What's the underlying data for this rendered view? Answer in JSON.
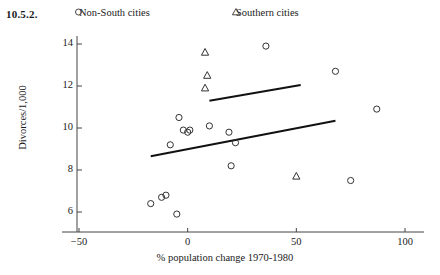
{
  "figure_number": "10.5.2.",
  "legend": [
    {
      "marker": "circle-marker-icon",
      "label": "Non-South cities"
    },
    {
      "marker": "triangle-marker-icon",
      "label": "Southern cities"
    }
  ],
  "chart_data": {
    "type": "scatter",
    "title": "",
    "xlabel": "% population change 1970-1980",
    "ylabel": "Divorces/1,000",
    "xlim": [
      -60,
      110
    ],
    "ylim": [
      5.2,
      14.8
    ],
    "xticks": [
      -50,
      0,
      50,
      100
    ],
    "xtick_labels": [
      "−50",
      "0",
      "50",
      "100"
    ],
    "yticks": [
      6,
      8,
      10,
      12,
      14
    ],
    "ytick_labels": [
      "6",
      "8",
      "10",
      "12",
      "14"
    ],
    "grid": false,
    "legend_position": "top",
    "series": [
      {
        "name": "Non-South cities",
        "marker": "circle",
        "points": [
          [
            -17,
            6.4
          ],
          [
            -12,
            6.7
          ],
          [
            -10,
            6.8
          ],
          [
            -5,
            5.9
          ],
          [
            -8,
            9.2
          ],
          [
            -4,
            10.5
          ],
          [
            -2,
            9.9
          ],
          [
            0,
            9.8
          ],
          [
            1,
            9.9
          ],
          [
            10,
            10.1
          ],
          [
            19,
            9.8
          ],
          [
            20,
            8.2
          ],
          [
            22,
            9.3
          ],
          [
            36,
            13.9
          ],
          [
            68,
            12.7
          ],
          [
            75,
            7.5
          ],
          [
            87,
            10.9
          ]
        ]
      },
      {
        "name": "Southern cities",
        "marker": "triangle",
        "points": [
          [
            8,
            13.6
          ],
          [
            9,
            12.5
          ],
          [
            8,
            11.9
          ],
          [
            50,
            7.7
          ]
        ]
      }
    ],
    "fit_lines": [
      {
        "name": "Southern cities fit",
        "x0": 10,
        "y0": 11.3,
        "x1": 52,
        "y1": 12.05
      },
      {
        "name": "Non-South cities fit",
        "x0": -17,
        "y0": 8.65,
        "x1": 68,
        "y1": 10.35
      }
    ]
  }
}
